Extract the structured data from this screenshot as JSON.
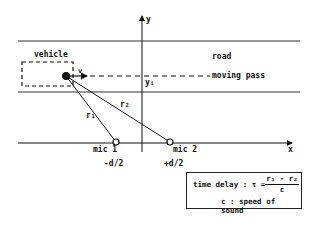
{
  "labels": {
    "vehicle": "vehicle",
    "velocity": "v",
    "road": "road",
    "moving_pass": "moving pass",
    "y_axis": "y",
    "x_axis": "x",
    "y_i": "yᵢ",
    "r1": "r₁",
    "r2": "r₂",
    "mic1": "mic 1",
    "mic2": "mic 2",
    "mic1_pos": "-d/2",
    "mic2_pos": "+d/2"
  },
  "formula": {
    "lhs": "time delay : τ =",
    "numerator": "r₁ - r₂",
    "denominator": "c",
    "note": "c : speed of sound"
  }
}
